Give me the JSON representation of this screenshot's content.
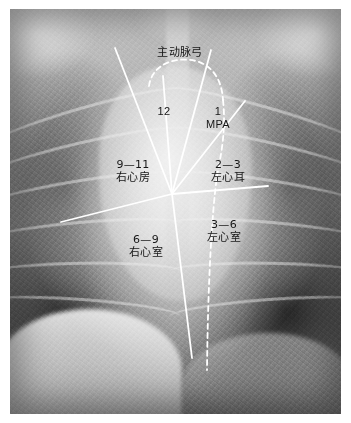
{
  "figure": {
    "type": "annotated-radiograph",
    "modality": "chest-x-ray",
    "view": "posteroanterior",
    "plate": {
      "x": 10,
      "y": 9,
      "width": 331,
      "height": 405
    },
    "vertex": {
      "x": 172,
      "y": 194
    }
  },
  "annotations": {
    "aortic_arch": {
      "text": "主动脉弓",
      "x": 180,
      "y": 46
    },
    "sector_12": {
      "number": "12",
      "name": "",
      "x": 164,
      "y": 105
    },
    "sector_1": {
      "number": "1",
      "name": "MPA",
      "x": 218,
      "y": 105
    },
    "sector_9_11": {
      "number": "9—11",
      "name": "右心房",
      "x": 133,
      "y": 158
    },
    "sector_2_3": {
      "number": "2—3",
      "name": "左心耳",
      "x": 228,
      "y": 158
    },
    "sector_6_9": {
      "number": "6—9",
      "name": "右心室",
      "x": 146,
      "y": 233
    },
    "sector_3_6": {
      "number": "3—6",
      "name": "左心室",
      "x": 224,
      "y": 218
    }
  },
  "overlay": {
    "stroke_color": "#ffffff",
    "stroke_width": 1.8,
    "dash_pattern": "5,4",
    "solid_lines": [
      {
        "name": "ray-right-atrium-upper",
        "x1": 115,
        "y1": 48,
        "x2": 172,
        "y2": 194
      },
      {
        "name": "ray-sector-12",
        "x1": 163,
        "y1": 76,
        "x2": 172,
        "y2": 194
      },
      {
        "name": "ray-mpa-right",
        "x1": 211,
        "y1": 50,
        "x2": 172,
        "y2": 194
      },
      {
        "name": "ray-left-atrial-app",
        "x1": 245,
        "y1": 101,
        "x2": 172,
        "y2": 194
      },
      {
        "name": "ray-horizontal-left",
        "x1": 61,
        "y1": 222,
        "x2": 172,
        "y2": 194
      },
      {
        "name": "ray-horizontal-right",
        "x1": 268,
        "y1": 186,
        "x2": 172,
        "y2": 194
      },
      {
        "name": "ray-ventricle-divider",
        "x1": 172,
        "y1": 194,
        "x2": 192,
        "y2": 358
      }
    ],
    "dashed_paths": [
      {
        "name": "aortic-arch-dome",
        "d": "M 149 86 C 152 64, 176 56, 196 61 C 214 66, 222 82, 223 100"
      },
      {
        "name": "left-heart-border",
        "d": "M 223 100 C 226 128, 222 150, 217 176 C 212 212, 208 280, 207 370"
      }
    ]
  },
  "ribs": {
    "left": [
      {
        "t": 17,
        "r": -16
      },
      {
        "t": 27,
        "r": -13
      },
      {
        "t": 38,
        "r": -9
      },
      {
        "t": 50,
        "r": -5
      },
      {
        "t": 62,
        "r": -1
      },
      {
        "t": 73,
        "r": 4
      }
    ],
    "right": [
      {
        "t": 17,
        "r": 16
      },
      {
        "t": 27,
        "r": 13
      },
      {
        "t": 38,
        "r": 9
      },
      {
        "t": 50,
        "r": 5
      },
      {
        "t": 62,
        "r": 1
      },
      {
        "t": 73,
        "r": -4
      }
    ]
  }
}
